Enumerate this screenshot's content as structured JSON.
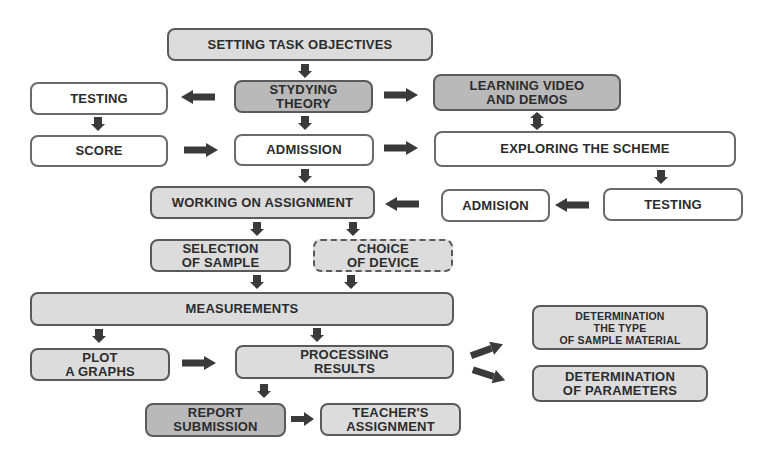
{
  "diagram": {
    "nodes": {
      "setting_task_objectives": "SETTING TASK OBJECTIVES",
      "stydying_theory": "STYDYING\nTHEORY",
      "learning_video": "LEARNING VIDEO\nAND DEMOS",
      "testing_left": "TESTING",
      "score": "SCORE",
      "admission": "ADMISSION",
      "exploring_scheme": "EXPLORING THE SCHEME",
      "working_on_assignment": "WORKING ON ASSIGNMENT",
      "admision_right": "ADMISION",
      "testing_right": "TESTING",
      "selection_of_sample": "SELECTION\nOF SAMPLE",
      "choice_of_device": "CHOICE\nOF DEVICE",
      "measurements": "MEASUREMENTS",
      "plot_graphs": "PLOT\nA GRAPHS",
      "processing_results": "PROCESSING\nRESULTS",
      "determination_type": "DETERMINATION\nTHE TYPE\nOF SAMPLE MATERIAL",
      "determination_parameters": "DETERMINATION\nOF PARAMETERS",
      "report_submission": "REPORT\nSUBMISSION",
      "teachers_assignment": "TEACHER'S\nASSIGNMENT"
    },
    "colors": {
      "light_fill": "#dcdcdc",
      "dark_fill": "#b9b9b9",
      "border": "#5a5a5a",
      "arrow": "#3a3a3a",
      "text": "#2c2c2c"
    }
  }
}
